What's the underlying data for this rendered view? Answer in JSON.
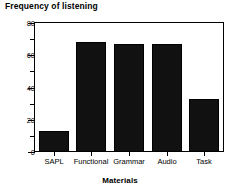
{
  "chart_data": {
    "type": "bar",
    "title": "Frequency of listening",
    "xlabel": "Materials",
    "ylabel": "",
    "categories": [
      "SAPL",
      "Functional",
      "Grammar",
      "Audio",
      "Task"
    ],
    "values": [
      13,
      68,
      67,
      67,
      33
    ],
    "ylim": [
      0,
      80
    ],
    "yticks_major": [
      0,
      20,
      40,
      60,
      80
    ],
    "yticks_minor": [
      10,
      30,
      50,
      70
    ],
    "ytick_labels": [
      "0",
      "20",
      "40",
      "60",
      "80"
    ],
    "grid": false,
    "legend": null,
    "bar_color": "#111111"
  }
}
